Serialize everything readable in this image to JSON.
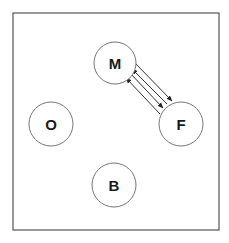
{
  "diagram": {
    "frame": {
      "x": 13,
      "y": 13,
      "width": 206,
      "height": 217,
      "stroke": "#555555"
    },
    "nodes": [
      {
        "id": "M",
        "label": "M",
        "cx": 115,
        "cy": 63,
        "r": 21
      },
      {
        "id": "F",
        "label": "F",
        "cx": 181,
        "cy": 124,
        "r": 22
      },
      {
        "id": "O",
        "label": "O",
        "cx": 51,
        "cy": 124,
        "r": 22
      },
      {
        "id": "B",
        "label": "B",
        "cx": 114,
        "cy": 185,
        "r": 22
      }
    ],
    "edges": [
      {
        "from": "M",
        "to": "F",
        "label": ""
      },
      {
        "from": "F",
        "to": "M",
        "label": ""
      },
      {
        "from": "M",
        "to": "F",
        "label": ""
      },
      {
        "from": "F",
        "to": "M",
        "label": ""
      }
    ],
    "colors": {
      "line": "#333333",
      "circle": "#777777",
      "text": "#1a1a1a"
    }
  }
}
